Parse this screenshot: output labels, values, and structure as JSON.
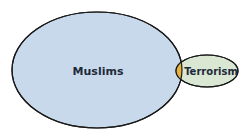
{
  "diagram": {
    "type": "venn",
    "sets": [
      {
        "id": "muslims",
        "label": "Muslims",
        "fill": "#c9d9ec",
        "stroke": "#1a1a1a"
      },
      {
        "id": "terrorism",
        "label": "Terrorism",
        "fill": "#d9e7d3",
        "stroke": "#1a1a1a"
      }
    ],
    "overlap": {
      "fill": "#e8b23e"
    }
  }
}
